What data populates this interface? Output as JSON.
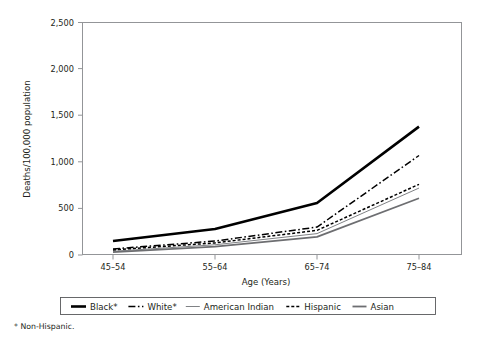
{
  "chart_data": {
    "type": "line",
    "title": "",
    "xlabel": "Age (Years)",
    "ylabel": "Deaths/100,000 population",
    "categories": [
      "45–54",
      "55–64",
      "65–74",
      "75–84"
    ],
    "ylim": [
      0,
      2500
    ],
    "yticks": [
      0,
      500,
      1000,
      1500,
      2000,
      2500
    ],
    "ytick_labels": [
      "0",
      "500",
      "1,000",
      "1,500",
      "2,000",
      "2,500"
    ],
    "grid": false,
    "legend_position": "bottom",
    "series": [
      {
        "name": "Black*",
        "values": [
          150,
          280,
          560,
          1380
        ],
        "style": "solid",
        "color": "#000000",
        "width": 2.6,
        "dash": ""
      },
      {
        "name": "White*",
        "values": [
          65,
          150,
          300,
          1070
        ],
        "style": "dash-dot",
        "color": "#000000",
        "width": 1.5,
        "dash": "7,2.5,1.6,2.5"
      },
      {
        "name": "American Indian",
        "values": [
          40,
          110,
          230,
          720
        ],
        "style": "solid-thin",
        "color": "#808285",
        "width": 1.0,
        "dash": ""
      },
      {
        "name": "Hispanic",
        "values": [
          55,
          130,
          265,
          760
        ],
        "style": "dashed",
        "color": "#000000",
        "width": 1.5,
        "dash": "3,2"
      },
      {
        "name": "Asian",
        "values": [
          30,
          90,
          195,
          610
        ],
        "style": "solid-medium",
        "color": "#6d6e71",
        "width": 1.8,
        "dash": ""
      }
    ]
  },
  "footnote": "* Non-Hispanic.",
  "legend": {
    "items": [
      {
        "label": "Black*"
      },
      {
        "label": "White*"
      },
      {
        "label": "American Indian"
      },
      {
        "label": "Hispanic"
      },
      {
        "label": "Asian"
      }
    ]
  }
}
